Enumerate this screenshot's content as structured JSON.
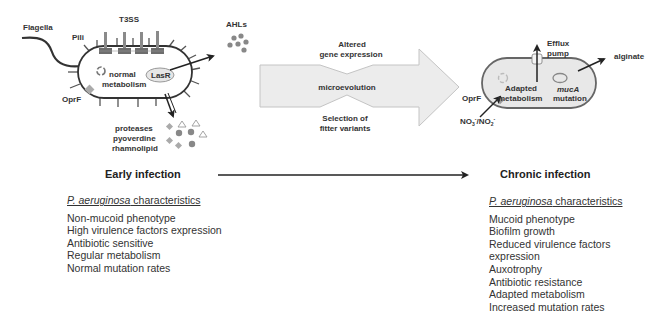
{
  "diagram": {
    "early_cell": {
      "labels": {
        "flagella": "Flagella",
        "pili": "Pili",
        "t3ss": "T3SS",
        "oprf": "OprF",
        "normal_metabolism_1": "normal",
        "normal_metabolism_2": "metabolism",
        "lasr": "LasR",
        "ahls": "AHLs",
        "secreted_1": "proteases",
        "secreted_2": "pyoverdine",
        "secreted_3": "rhamnolipid"
      }
    },
    "transition_arrow": {
      "top_1": "Altered",
      "top_2": "gene expression",
      "middle": "microevolution",
      "bottom_1": "Selection of",
      "bottom_2": "fitter variants",
      "fill_color": "#ececec",
      "stroke_color": "#c4c4c4"
    },
    "chronic_cell": {
      "labels": {
        "efflux_1": "Efflux",
        "efflux_2": "pump",
        "alginate": "alginate",
        "oprf": "OprF",
        "nitrate": "NO3-/NO2-",
        "adapted_1": "Adapted",
        "adapted_2": "metabolism",
        "muca_1": "mucA",
        "muca_2": "mutation"
      },
      "fill_color": "#e8e8e8"
    }
  },
  "early_infection": {
    "heading": "Early infection",
    "characteristics_species": "P. aeruginosa",
    "characteristics_suffix": " characteristics",
    "items": [
      "Non-mucoid phenotype",
      "High virulence factors expression",
      "Antibiotic sensitive",
      "Regular metabolism",
      "Normal mutation rates"
    ]
  },
  "chronic_infection": {
    "heading": "Chronic infection",
    "characteristics_species": "P. aeruginosa",
    "characteristics_suffix": " characteristics",
    "items": [
      "Mucoid phenotype",
      "Biofilm growth",
      "Reduced virulence factors",
      "expression",
      "Auxotrophy",
      "Antibiotic resistance",
      "Adapted metabolism",
      "Increased mutation rates"
    ]
  }
}
